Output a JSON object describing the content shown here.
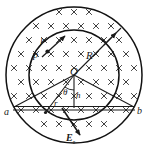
{
  "figure": {
    "field_symbol": "×",
    "field_meaning": "magnetic-field-into-page",
    "stroke_color": "#1a1a1a",
    "background_color": "#ffffff",
    "geometry": {
      "center_x": 74,
      "center_y": 75,
      "outer_radius": 68,
      "inner_radius": 45,
      "chord_y": 108,
      "chord_x_left": 14,
      "chord_x_right": 134
    }
  },
  "labels": {
    "center": "O",
    "radius": "R",
    "point_p": "P",
    "length_l": "l",
    "point_a": "a",
    "point_b": "b",
    "radius_r": "r",
    "height_h": "h",
    "angle_theta": "θ",
    "field_E": "E",
    "field_E_sub": "τ"
  },
  "field_grid": {
    "symbol": "×",
    "rows": 9,
    "cols": 9,
    "spacing_x": 15,
    "spacing_y": 14,
    "origin_x": 14,
    "origin_y": 12
  },
  "chart_data": {
    "type": "diagram",
    "elements": [
      {
        "name": "outer-circle",
        "kind": "circle",
        "cx": 74,
        "cy": 75,
        "r": 68
      },
      {
        "name": "inner-circle",
        "kind": "circle",
        "cx": 74,
        "cy": 75,
        "r": 45
      },
      {
        "name": "radius-line",
        "kind": "line",
        "x1": 74,
        "y1": 75,
        "x2": 122,
        "y2": 27,
        "label": "R",
        "arrow": true
      },
      {
        "name": "chord-ab",
        "kind": "line",
        "x1": 14,
        "y1": 108,
        "x2": 134,
        "y2": 108,
        "label_left": "a",
        "label_right": "b"
      },
      {
        "name": "line-O-a",
        "kind": "line",
        "x1": 74,
        "y1": 75,
        "x2": 14,
        "y2": 108
      },
      {
        "name": "line-O-b",
        "kind": "line",
        "x1": 74,
        "y1": 75,
        "x2": 134,
        "y2": 108
      },
      {
        "name": "line-O-r",
        "kind": "line",
        "x1": 74,
        "y1": 75,
        "x2": 46,
        "y2": 112,
        "label": "r"
      },
      {
        "name": "height-h",
        "kind": "line",
        "x1": 74,
        "y1": 75,
        "x2": 74,
        "y2": 108,
        "label": "h"
      },
      {
        "name": "angle-theta",
        "kind": "angle",
        "vertex_x": 74,
        "vertex_y": 75,
        "label": "θ"
      },
      {
        "name": "point-P",
        "kind": "point",
        "x": 48,
        "y": 51,
        "label": "P"
      },
      {
        "name": "tangent-arrow-P",
        "kind": "vector",
        "x1": 44,
        "y1": 56,
        "x2": 66,
        "y2": 36
      },
      {
        "name": "E-tau-vector",
        "kind": "vector",
        "x1": 62,
        "y1": 110,
        "x2": 81,
        "y2": 136,
        "label": "Eτ"
      }
    ]
  }
}
